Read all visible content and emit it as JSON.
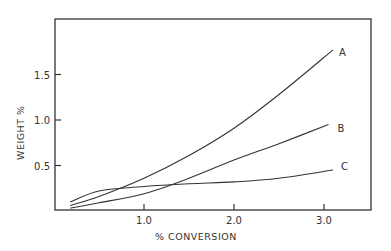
{
  "chart_data": {
    "type": "line",
    "title": "",
    "xlabel": "% CONVERSION",
    "ylabel": "WEIGHT %",
    "xlim": [
      0,
      3.5
    ],
    "ylim": [
      0,
      2.1
    ],
    "xticks": [
      1.0,
      2.0,
      3.0
    ],
    "xtick_labels": [
      "1.0",
      "2.0",
      "3.0"
    ],
    "yticks": [
      0.5,
      1.0,
      1.5
    ],
    "ytick_labels": [
      "0.5",
      "1.0",
      "1.5"
    ],
    "grid": false,
    "legend": "inline labels at line ends",
    "series": [
      {
        "name": "A",
        "x": [
          0.18,
          0.5,
          1.0,
          1.5,
          2.0,
          2.5,
          3.1
        ],
        "values": [
          0.06,
          0.16,
          0.36,
          0.61,
          0.91,
          1.28,
          1.77
        ]
      },
      {
        "name": "B",
        "x": [
          0.18,
          0.5,
          1.0,
          1.5,
          2.0,
          2.5,
          3.05
        ],
        "values": [
          0.03,
          0.09,
          0.19,
          0.36,
          0.56,
          0.74,
          0.95
        ]
      },
      {
        "name": "C",
        "x": [
          0.18,
          0.5,
          1.0,
          1.5,
          2.0,
          2.5,
          3.1
        ],
        "values": [
          0.1,
          0.22,
          0.27,
          0.3,
          0.32,
          0.36,
          0.45
        ]
      }
    ]
  },
  "axes": {
    "x_title": "%  CONVERSION",
    "y_title": "WEIGHT  %"
  }
}
